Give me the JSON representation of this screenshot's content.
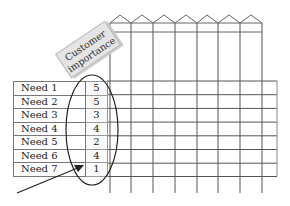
{
  "label_card": {
    "line1": "Customer",
    "line2": "importance"
  },
  "needs": [
    {
      "label": "Need 1",
      "importance": "5"
    },
    {
      "label": "Need 2",
      "importance": "5"
    },
    {
      "label": "Need 3",
      "importance": "3"
    },
    {
      "label": "Need 4",
      "importance": "4"
    },
    {
      "label": "Need 5",
      "importance": "2"
    },
    {
      "label": "Need 6",
      "importance": "4"
    },
    {
      "label": "Need 7",
      "importance": "1"
    }
  ],
  "grid": {
    "columns": 7,
    "line_color": "#555555"
  }
}
